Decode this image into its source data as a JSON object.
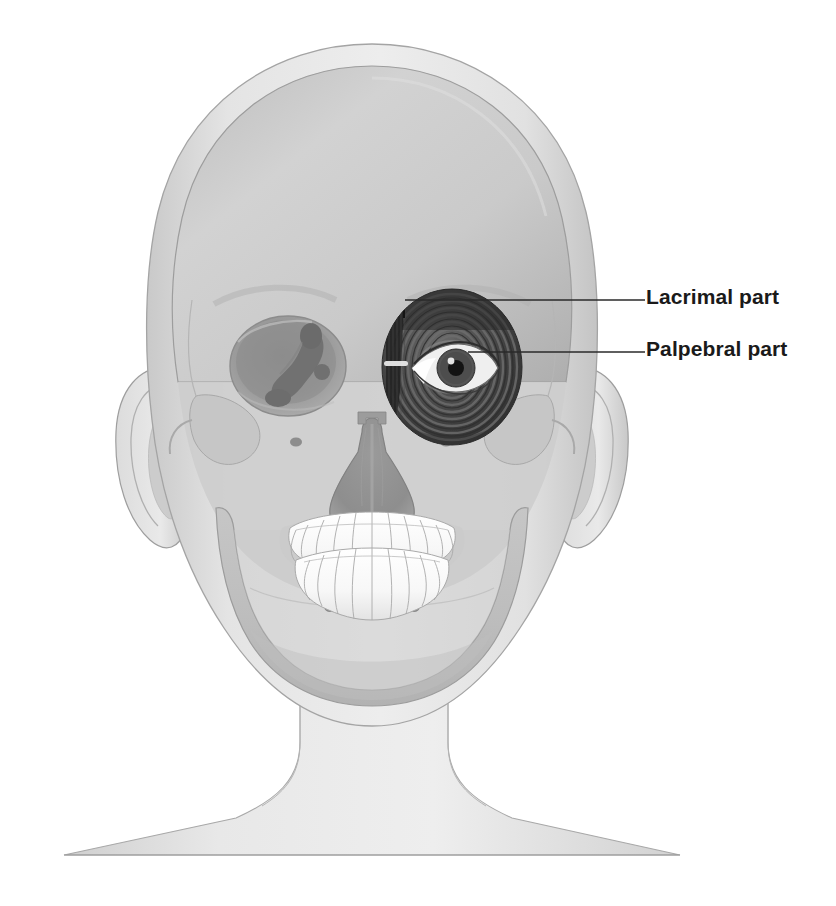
{
  "figure": {
    "background_color": "#ffffff",
    "view": "anterior",
    "style": "grayscale medical illustration"
  },
  "labels": [
    {
      "id": "lacrimal",
      "text": "Lacrimal part",
      "leader_from_x": 405,
      "leader_from_y": 300,
      "leader_to_x": 645,
      "leader_to_y": 300,
      "text_x": 646,
      "text_y": 285
    },
    {
      "id": "palpebral",
      "text": "Palpebral part",
      "leader_from_x": 468,
      "leader_from_y": 352,
      "leader_to_x": 645,
      "leader_to_y": 352,
      "text_x": 646,
      "text_y": 337
    }
  ],
  "colors": {
    "background": "#ffffff",
    "skin_light": "#e8e8e8",
    "skin_mid": "#d4d4d4",
    "skin_shadow": "#bcbcbc",
    "skull_light": "#d8d8d8",
    "skull_mid": "#c2c2c2",
    "skull_shadow": "#a6a6a6",
    "orbit_dark": "#8e8e8e",
    "orbit_deep": "#7a7a7a",
    "muscle_dark": "#3a3a3a",
    "muscle_mid": "#555555",
    "muscle_light": "#787878",
    "teeth": "#fbfbfb",
    "teeth_outline": "#a9a9a9",
    "eye_sclera": "#e6e6e6",
    "eye_iris": "#4a4a4a",
    "eye_pupil": "#141414",
    "leader_line": "#2a2a2a",
    "label_text": "#1a1a1a",
    "outline": "#8a8a8a"
  },
  "anatomy": {
    "head_outline": "skin silhouette of head, ears, neck and shoulders",
    "cranium": "calvaria / frontal bone vault",
    "right_orbit": "bony orbit with lacrimal sac and nasolacrimal duct visible",
    "left_orbit_muscle": "orbicularis oculi with concentric fibre rings",
    "nasal_aperture": "piriform aperture with nasal septum",
    "maxilla_teeth": "upper dental arch",
    "mandible_teeth": "lower dental arch",
    "foramina": "infraorbital and mental foramina",
    "ears": "left and right auricles",
    "zygomatic": "zygomatic bone and arch"
  }
}
